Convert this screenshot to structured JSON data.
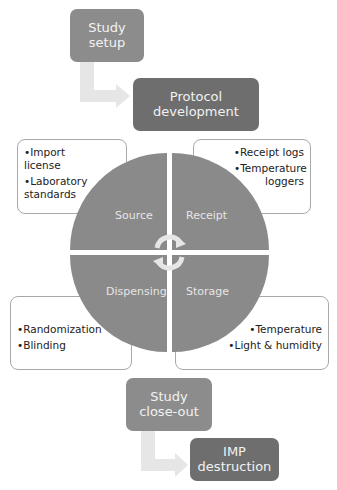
{
  "top_flow": {
    "step1": {
      "line1": "Study",
      "line2": "setup"
    },
    "step2": {
      "line1": "Protocol",
      "line2": "development"
    }
  },
  "cycle": {
    "quadrants": [
      {
        "label": "Source",
        "notes": [
          "Import license",
          "Laboratory standards"
        ]
      },
      {
        "label": "Receipt",
        "notes": [
          "Receipt logs",
          "Temperature loggers"
        ]
      },
      {
        "label": "Dispensing",
        "notes": [
          "Randomization",
          "Blinding"
        ]
      },
      {
        "label": "Storage",
        "notes": [
          "Temperature",
          "Light & humidity"
        ]
      }
    ],
    "center_icon": "circular-arrows-icon"
  },
  "bottom_flow": {
    "step1": {
      "line1": "Study",
      "line2": "close-out"
    },
    "step2": {
      "line1": "IMP",
      "line2": "destruction"
    }
  },
  "colors": {
    "light_box": "#8c8c8c",
    "dark_box": "#6e6e6e",
    "circle": "#8a8a8a",
    "arrow": "#e6e6e6"
  }
}
